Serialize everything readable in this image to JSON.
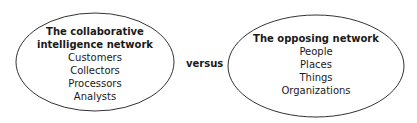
{
  "diagram": {
    "left": {
      "title_lines": [
        "The collaborative",
        "intelligence network"
      ],
      "items": [
        "Customers",
        "Collectors",
        "Processors",
        "Analysts"
      ]
    },
    "connector_label": "versus",
    "right": {
      "title_lines": [
        "The opposing network"
      ],
      "items": [
        "People",
        "Places",
        "Things",
        "Organizations"
      ]
    }
  }
}
